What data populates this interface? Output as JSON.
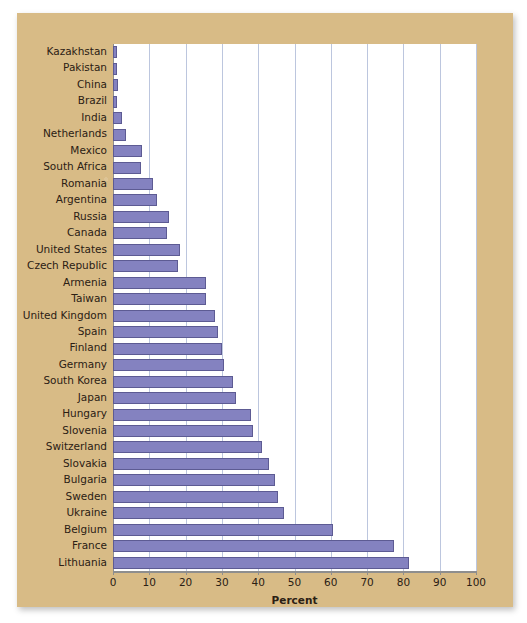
{
  "chart_data": {
    "type": "bar",
    "orientation": "horizontal",
    "title": "",
    "xlabel": "Percent",
    "ylabel": "",
    "xlim": [
      0,
      100
    ],
    "xticks": [
      0,
      10,
      20,
      30,
      40,
      50,
      60,
      70,
      80,
      90,
      100
    ],
    "grid": true,
    "legend": false,
    "bar_color": "#8482c0",
    "bar_edge_color": "#5d5b93",
    "plot_background": "#ffffff",
    "panel_background": "#d8bb86",
    "gridline_color": "#bcc6de",
    "categories": [
      "Kazakhstan",
      "Pakistan",
      "China",
      "Brazil",
      "India",
      "Netherlands",
      "Mexico",
      "South Africa",
      "Romania",
      "Argentina",
      "Russia",
      "Canada",
      "United States",
      "Czech Republic",
      "Armenia",
      "Taiwan",
      "United Kingdom",
      "Spain",
      "Finland",
      "Germany",
      "South Korea",
      "Japan",
      "Hungary",
      "Slovenia",
      "Switzerland",
      "Slovakia",
      "Bulgaria",
      "Sweden",
      "Ukraine",
      "Belgium",
      "France",
      "Lithuania"
    ],
    "values": [
      1.0,
      1.2,
      1.4,
      1.2,
      2.5,
      3.5,
      8.0,
      7.8,
      11.0,
      12.0,
      15.5,
      15.0,
      18.5,
      18.0,
      25.5,
      25.5,
      28.0,
      29.0,
      30.0,
      30.5,
      33.0,
      34.0,
      38.0,
      38.5,
      41.0,
      43.0,
      44.5,
      45.5,
      47.0,
      60.5,
      77.5,
      81.5
    ]
  }
}
